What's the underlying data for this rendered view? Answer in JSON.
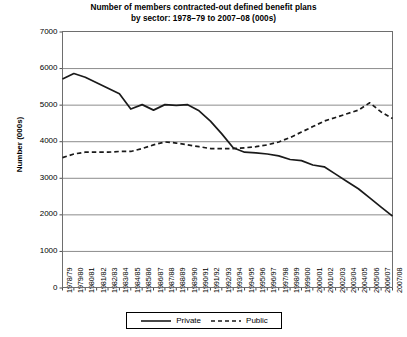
{
  "chart_data": {
    "type": "line",
    "title": "Number of members contracted-out defined benefit plans by sector: 1978–79 to 2007–08 (000s)",
    "title_line1": "Number of members contracted-out defined benefit plans",
    "title_line2": "by sector: 1978–79 to 2007–08 (000s)",
    "xlabel": "",
    "ylabel": "Number (000s)",
    "ylim": [
      0,
      7000
    ],
    "ytick_labels": [
      "7000",
      "6000",
      "5000",
      "4000",
      "3000",
      "2000",
      "1000",
      "0"
    ],
    "ytick_values": [
      7000,
      6000,
      5000,
      4000,
      3000,
      2000,
      1000,
      0
    ],
    "grid": "horizontal",
    "legend_position": "bottom",
    "categories": [
      "1978/79",
      "1979/80",
      "1980/81",
      "1981/82",
      "1982/83",
      "1983/84",
      "1984/85",
      "1985/86",
      "1986/87",
      "1987/88",
      "1988/89",
      "1989/90",
      "1990/91",
      "1991/92",
      "1992/93",
      "1993/94",
      "1994/95",
      "1995/96",
      "1996/97",
      "1997/98",
      "1998/99",
      "1999/00",
      "2000/01",
      "2001/02",
      "2002/03",
      "2003/04",
      "2004/05",
      "2005/06",
      "2006/07",
      "2007/08"
    ],
    "series": [
      {
        "name": "Private",
        "style": "solid",
        "color": "#1a1a1a",
        "values": [
          5700,
          5850,
          5750,
          5600,
          5450,
          5300,
          4880,
          5000,
          4850,
          5000,
          4980,
          5000,
          4830,
          4550,
          4200,
          3820,
          3700,
          3680,
          3650,
          3600,
          3500,
          3470,
          3350,
          3300,
          3100,
          2900,
          2700,
          2450,
          2200,
          1950
        ]
      },
      {
        "name": "Public",
        "style": "dashed",
        "color": "#1a1a1a",
        "values": [
          3550,
          3650,
          3700,
          3700,
          3700,
          3720,
          3720,
          3800,
          3900,
          3980,
          3950,
          3900,
          3850,
          3800,
          3800,
          3800,
          3820,
          3850,
          3900,
          3980,
          4100,
          4250,
          4400,
          4550,
          4650,
          4750,
          4850,
          5050,
          4800,
          4620
        ]
      }
    ]
  },
  "legend": {
    "items": [
      {
        "label": "Private",
        "style": "solid"
      },
      {
        "label": "Public",
        "style": "dashed"
      }
    ]
  }
}
